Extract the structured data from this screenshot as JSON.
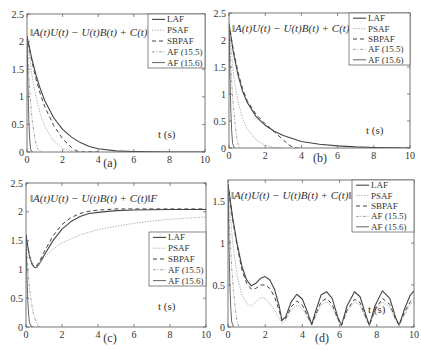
{
  "figure": {
    "width": 421,
    "height": 351
  },
  "styles": {
    "axis_color": "#555555",
    "series": {
      "LAF": {
        "color": "#444444",
        "width": 1.1,
        "dash": ""
      },
      "PSAF": {
        "color": "#b8b8b8",
        "width": 1.0,
        "dash": "1.5,1.2"
      },
      "SBPAF": {
        "color": "#444444",
        "width": 1.0,
        "dash": "4,3"
      },
      "AF (15.5)": {
        "color": "#8a8a8a",
        "width": 0.8,
        "dash": "3,1.5,1,1.5"
      },
      "AF (15.6)": {
        "color": "#555555",
        "width": 0.9,
        "dash": ""
      }
    }
  },
  "chart_data": [
    {
      "id": "a",
      "type": "line",
      "title": "",
      "caption": "(a)",
      "annotation": "‖A(t)U(t) − U(t)B(t) + C(t)‖F",
      "xlabel": "t (s)",
      "ylabel": "",
      "xlim": [
        0,
        10
      ],
      "ylim": [
        0,
        2.5
      ],
      "xticks": [
        0,
        2,
        4,
        6,
        8,
        10
      ],
      "yticks": [
        0,
        0.5,
        1,
        1.5,
        2,
        2.5
      ],
      "ytick_labels": [
        "0",
        "0.5",
        "1",
        "1.5",
        "2",
        "2.5"
      ],
      "legend": [
        "LAF",
        "PSAF",
        "SBPAF",
        "AF (15.5)",
        "AF (15.6)"
      ],
      "legend_position": "upper right",
      "grid": false,
      "box": {
        "x": 27,
        "y": 14,
        "w": 178,
        "h": 138
      },
      "series": [
        {
          "name": "LAF",
          "x": [
            0,
            0.25,
            0.5,
            0.75,
            1,
            1.5,
            2,
            2.5,
            3,
            3.5,
            4,
            5,
            6,
            8,
            10
          ],
          "y": [
            2.1,
            1.72,
            1.4,
            1.14,
            0.93,
            0.62,
            0.41,
            0.27,
            0.17,
            0.1,
            0.06,
            0.02,
            0.01,
            0.0,
            0.0
          ]
        },
        {
          "name": "PSAF",
          "x": [
            0,
            0.25,
            0.5,
            0.75,
            1,
            1.5,
            2,
            2.5,
            3,
            4
          ],
          "y": [
            2.1,
            1.45,
            1.0,
            0.68,
            0.46,
            0.2,
            0.07,
            0.02,
            0.0,
            0.0
          ]
        },
        {
          "name": "SBPAF",
          "x": [
            0,
            0.25,
            0.5,
            0.75,
            1,
            1.5,
            2,
            2.5,
            2.8,
            3,
            4
          ],
          "y": [
            2.1,
            1.68,
            1.33,
            1.05,
            0.82,
            0.48,
            0.24,
            0.08,
            0.02,
            0.0,
            0.0
          ]
        },
        {
          "name": "AF (15.5)",
          "x": [
            0,
            0.1,
            0.2,
            0.3,
            0.45,
            0.6,
            0.8
          ],
          "y": [
            2.1,
            1.4,
            0.9,
            0.55,
            0.22,
            0.05,
            0.0
          ]
        },
        {
          "name": "AF (15.6)",
          "x": [
            0,
            0.05,
            0.1,
            0.15,
            0.2,
            0.3
          ],
          "y": [
            2.1,
            1.3,
            0.6,
            0.25,
            0.05,
            0.0
          ]
        }
      ]
    },
    {
      "id": "b",
      "type": "line",
      "title": "",
      "caption": "(b)",
      "annotation": "‖A(t)U(t) − U(t)B(t) + C(t)‖F",
      "xlabel": "t (s)",
      "ylabel": "",
      "xlim": [
        0,
        10
      ],
      "ylim": [
        0,
        2.5
      ],
      "xticks": [
        0,
        2,
        4,
        6,
        8,
        10
      ],
      "yticks": [
        0,
        0.5,
        1,
        1.5,
        2,
        2.5
      ],
      "ytick_labels": [
        "0",
        "0.5",
        "1",
        "1.5",
        "2",
        "2.5"
      ],
      "legend": [
        "LAF",
        "PSAF",
        "SBPAF",
        "AF (15.5)",
        "AF (15.6)"
      ],
      "legend_position": "upper right",
      "grid": false,
      "box": {
        "x": 229,
        "y": 13,
        "w": 181,
        "h": 135
      },
      "series": [
        {
          "name": "LAF",
          "x": [
            0,
            0.25,
            0.5,
            0.75,
            1,
            1.5,
            2,
            2.5,
            3,
            4,
            5,
            6,
            7,
            8,
            10
          ],
          "y": [
            2.3,
            1.75,
            1.35,
            1.05,
            0.85,
            0.58,
            0.42,
            0.31,
            0.23,
            0.12,
            0.07,
            0.04,
            0.02,
            0.01,
            0.0
          ]
        },
        {
          "name": "PSAF",
          "x": [
            0,
            0.25,
            0.5,
            0.75,
            1,
            1.5,
            2,
            2.5,
            3
          ],
          "y": [
            2.3,
            1.35,
            0.85,
            0.55,
            0.36,
            0.15,
            0.05,
            0.01,
            0.0
          ]
        },
        {
          "name": "SBPAF",
          "x": [
            0,
            0.25,
            0.5,
            0.75,
            1,
            1.5,
            2,
            2.5,
            3,
            3.3,
            3.6,
            4
          ],
          "y": [
            2.3,
            1.8,
            1.4,
            1.1,
            0.88,
            0.62,
            0.45,
            0.3,
            0.15,
            0.06,
            0.0,
            0.0
          ]
        },
        {
          "name": "AF (15.5)",
          "x": [
            0,
            0.1,
            0.2,
            0.3,
            0.4,
            0.5,
            0.6
          ],
          "y": [
            2.3,
            1.5,
            0.95,
            0.55,
            0.25,
            0.07,
            0.0
          ]
        },
        {
          "name": "AF (15.6)",
          "x": [
            0,
            0.05,
            0.1,
            0.15,
            0.2,
            0.3
          ],
          "y": [
            2.3,
            1.4,
            0.7,
            0.3,
            0.08,
            0.0
          ]
        }
      ]
    },
    {
      "id": "c",
      "type": "line",
      "title": "",
      "caption": "(c)",
      "annotation": "‖A(t)U(t) − U(t)B(t) + C(t)‖F",
      "xlabel": "t (s)",
      "ylabel": "",
      "xlim": [
        0,
        10
      ],
      "ylim": [
        0,
        2.5
      ],
      "xticks": [
        0,
        2,
        4,
        6,
        8,
        10
      ],
      "yticks": [
        0,
        0.5,
        1,
        1.5,
        2,
        2.5
      ],
      "ytick_labels": [
        "0",
        "0.5",
        "1",
        "1.5",
        "2",
        "2.5"
      ],
      "legend": [
        "LAF",
        "PSAF",
        "SBPAF",
        "AF (15.5)",
        "AF (15.6)"
      ],
      "legend_position": "center right",
      "grid": false,
      "box": {
        "x": 26,
        "y": 183,
        "w": 180,
        "h": 144
      },
      "series": [
        {
          "name": "LAF",
          "x": [
            0,
            0.1,
            0.2,
            0.35,
            0.5,
            0.6,
            0.75,
            1,
            1.5,
            2,
            2.5,
            3,
            3.5,
            4,
            5,
            6,
            8,
            10
          ],
          "y": [
            1.6,
            1.4,
            1.22,
            1.08,
            1.03,
            1.04,
            1.1,
            1.24,
            1.5,
            1.7,
            1.83,
            1.92,
            1.97,
            1.99,
            2.02,
            2.03,
            2.04,
            2.04
          ]
        },
        {
          "name": "PSAF",
          "x": [
            0,
            0.1,
            0.2,
            0.35,
            0.5,
            0.6,
            0.75,
            1,
            1.5,
            2,
            3,
            4,
            5,
            6,
            7,
            8,
            9,
            10
          ],
          "y": [
            1.6,
            1.4,
            1.22,
            1.08,
            1.04,
            1.05,
            1.1,
            1.2,
            1.35,
            1.46,
            1.6,
            1.69,
            1.75,
            1.8,
            1.84,
            1.87,
            1.89,
            1.91
          ]
        },
        {
          "name": "SBPAF",
          "x": [
            0,
            0.1,
            0.2,
            0.35,
            0.5,
            0.6,
            0.75,
            1,
            1.5,
            2,
            2.5,
            3,
            3.5,
            4,
            5,
            6,
            8,
            10
          ],
          "y": [
            1.6,
            1.4,
            1.22,
            1.09,
            1.05,
            1.07,
            1.14,
            1.3,
            1.58,
            1.78,
            1.9,
            1.97,
            2.01,
            2.03,
            2.05,
            2.05,
            2.05,
            2.05
          ]
        },
        {
          "name": "AF (15.5)",
          "x": [
            0,
            0.1,
            0.2,
            0.3,
            0.4,
            0.5,
            0.6,
            0.7,
            0.8
          ],
          "y": [
            1.6,
            1.0,
            0.65,
            0.42,
            0.25,
            0.14,
            0.06,
            0.01,
            0.0
          ]
        },
        {
          "name": "AF (15.6)",
          "x": [
            0,
            0.05,
            0.1,
            0.15,
            0.2,
            0.3,
            0.4
          ],
          "y": [
            1.6,
            0.9,
            0.45,
            0.2,
            0.07,
            0.01,
            0.0
          ]
        }
      ]
    },
    {
      "id": "d",
      "type": "line",
      "title": "",
      "caption": "(d)",
      "annotation": "‖A(t)U(t) − U(t)B(t) + C(t)‖F",
      "xlabel": "t (s)",
      "ylabel": "",
      "xlim": [
        0,
        10
      ],
      "ylim": [
        0,
        1.75
      ],
      "xticks": [
        0,
        2,
        4,
        6,
        8,
        10
      ],
      "yticks": [
        0,
        0.5,
        1,
        1.5
      ],
      "ytick_labels": [
        "0",
        "0.5",
        "1",
        "1.5"
      ],
      "legend": [
        "LAF",
        "PSAF",
        "SBPAF",
        "AF (15.5)",
        "AF (15.6)"
      ],
      "legend_position": "upper right",
      "grid": false,
      "box": {
        "x": 228,
        "y": 180,
        "w": 186,
        "h": 147
      },
      "series": [
        {
          "name": "LAF",
          "x": [
            0,
            0.25,
            0.5,
            0.75,
            1,
            1.25,
            1.5,
            1.75,
            2,
            2.25,
            2.5,
            2.75,
            2.9,
            3.1,
            3.4,
            3.7,
            4.0,
            4.3,
            4.5,
            4.7,
            5.0,
            5.3,
            5.6,
            5.9,
            6.1,
            6.4,
            6.8,
            7.1,
            7.4,
            7.6,
            7.9,
            8.3,
            8.7,
            9.0,
            9.2,
            9.5,
            9.8,
            10
          ],
          "y": [
            1.7,
            1.3,
            0.98,
            0.72,
            0.56,
            0.49,
            0.52,
            0.58,
            0.6,
            0.56,
            0.45,
            0.25,
            0.08,
            0.12,
            0.3,
            0.39,
            0.33,
            0.16,
            0.03,
            0.18,
            0.38,
            0.42,
            0.34,
            0.12,
            0.02,
            0.25,
            0.42,
            0.36,
            0.15,
            0.02,
            0.25,
            0.43,
            0.34,
            0.12,
            0.02,
            0.22,
            0.38,
            0.43
          ]
        },
        {
          "name": "PSAF",
          "x": [
            0,
            0.25,
            0.5,
            0.75,
            1,
            1.25,
            1.5,
            1.75,
            2,
            2.25,
            2.5,
            2.75,
            2.9,
            3.1,
            3.4,
            3.7,
            4.0,
            4.3,
            4.5,
            4.7,
            5.0,
            5.3,
            5.6,
            5.9,
            6.1,
            6.4,
            6.8,
            7.1,
            7.4,
            7.6,
            7.9,
            8.3,
            8.7,
            9.0,
            9.2,
            9.5,
            9.8,
            10
          ],
          "y": [
            1.7,
            1.0,
            0.6,
            0.38,
            0.28,
            0.25,
            0.3,
            0.35,
            0.34,
            0.28,
            0.2,
            0.1,
            0.04,
            0.08,
            0.2,
            0.26,
            0.22,
            0.1,
            0.02,
            0.12,
            0.26,
            0.3,
            0.24,
            0.08,
            0.02,
            0.18,
            0.3,
            0.26,
            0.1,
            0.02,
            0.18,
            0.3,
            0.24,
            0.08,
            0.02,
            0.15,
            0.27,
            0.3
          ]
        },
        {
          "name": "SBPAF",
          "x": [
            0,
            0.25,
            0.5,
            0.75,
            1,
            1.25,
            1.5,
            1.75,
            2,
            2.25,
            2.5,
            2.75,
            2.9,
            3.1,
            3.4,
            3.7,
            4.0,
            4.3,
            4.5,
            4.7,
            5.0,
            5.3,
            5.6,
            5.9,
            6.1,
            6.4,
            6.8,
            7.1,
            7.4,
            7.6,
            7.9,
            8.3,
            8.7,
            9.0,
            9.2,
            9.5,
            9.8,
            10
          ],
          "y": [
            1.7,
            1.28,
            0.95,
            0.68,
            0.52,
            0.45,
            0.46,
            0.5,
            0.5,
            0.46,
            0.36,
            0.2,
            0.07,
            0.1,
            0.24,
            0.31,
            0.26,
            0.12,
            0.03,
            0.14,
            0.3,
            0.34,
            0.27,
            0.1,
            0.02,
            0.2,
            0.33,
            0.29,
            0.12,
            0.02,
            0.2,
            0.34,
            0.27,
            0.1,
            0.02,
            0.18,
            0.3,
            0.34
          ]
        },
        {
          "name": "AF (15.5)",
          "x": [
            0,
            0.1,
            0.2,
            0.3,
            0.4,
            0.5,
            0.6
          ],
          "y": [
            1.7,
            1.1,
            0.7,
            0.42,
            0.2,
            0.05,
            0.0
          ]
        },
        {
          "name": "AF (15.6)",
          "x": [
            0,
            0.05,
            0.1,
            0.15,
            0.2,
            0.3
          ],
          "y": [
            1.7,
            1.0,
            0.5,
            0.22,
            0.06,
            0.0
          ]
        }
      ]
    }
  ],
  "layout": {
    "legends": {
      "a": {
        "x": 148,
        "y": 14,
        "w": 57,
        "h": 54
      },
      "b": {
        "x": 349,
        "y": 13,
        "w": 61,
        "h": 52
      },
      "c": {
        "x": 149,
        "y": 232,
        "w": 57,
        "h": 54
      },
      "d": {
        "x": 352,
        "y": 180,
        "w": 62,
        "h": 52
      }
    },
    "annotations": {
      "a": {
        "x": 30,
        "y": 36
      },
      "b": {
        "x": 232,
        "y": 32
      },
      "c": {
        "x": 30,
        "y": 202
      },
      "d": {
        "x": 231,
        "y": 199
      }
    },
    "tlabels": {
      "a": {
        "x": 158,
        "y": 138
      },
      "b": {
        "x": 366,
        "y": 134
      },
      "c": {
        "x": 158,
        "y": 310
      },
      "d": {
        "x": 368,
        "y": 313
      }
    },
    "captions": {
      "a": {
        "x": 110,
        "y": 167
      },
      "b": {
        "x": 320,
        "y": 162
      },
      "c": {
        "x": 110,
        "y": 342
      },
      "d": {
        "x": 322,
        "y": 342
      }
    }
  }
}
